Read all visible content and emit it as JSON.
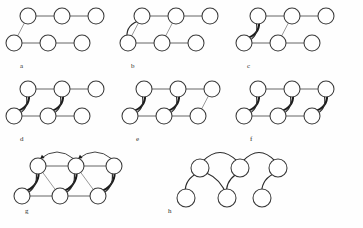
{
  "figure": {
    "background_color": "#fefefe",
    "node_fill": "#ffffff",
    "node_stroke": "#3a3a3a",
    "edge_color": "#555555",
    "curve_color": "#2b2b2b",
    "arrow_color": "#1a1a1a",
    "width": 363,
    "height": 228,
    "panel_count": 8
  },
  "panels": [
    {
      "label": "a",
      "label_x": 20,
      "label_y": 68,
      "origin_x": 14,
      "origin_y": 8,
      "node_count": 6,
      "description": "base lattice: top row three nodes, bottom row three nodes, one diagonal",
      "nodes": [
        {
          "id": "t1",
          "cx": 28,
          "cy": 16,
          "r": 8
        },
        {
          "id": "t2",
          "cx": 62,
          "cy": 16,
          "r": 8
        },
        {
          "id": "t3",
          "cx": 96,
          "cy": 16,
          "r": 8
        },
        {
          "id": "b1",
          "cx": 14,
          "cy": 43,
          "r": 8
        },
        {
          "id": "b2",
          "cx": 48,
          "cy": 43,
          "r": 8
        },
        {
          "id": "b3",
          "cx": 82,
          "cy": 43,
          "r": 8
        }
      ],
      "straight_edges": [
        {
          "from": "t3",
          "to": "t2"
        },
        {
          "from": "t2",
          "to": "t1"
        },
        {
          "from": "b1",
          "to": "b2"
        },
        {
          "from": "b2",
          "to": "b3"
        }
      ],
      "diagonal_edges": [
        {
          "from": "b1",
          "to": "t1"
        }
      ],
      "curved_edges": []
    },
    {
      "label": "b",
      "label_x": 131,
      "label_y": 68,
      "origin_x": 128,
      "origin_y": 8,
      "node_count": 6,
      "description": "adds a curved return edge t1->b1 and a thin diagonal b2->t2",
      "nodes": [
        {
          "id": "t1",
          "cx": 142,
          "cy": 16,
          "r": 8
        },
        {
          "id": "t2",
          "cx": 176,
          "cy": 16,
          "r": 8
        },
        {
          "id": "t3",
          "cx": 210,
          "cy": 16,
          "r": 8
        },
        {
          "id": "b1",
          "cx": 128,
          "cy": 43,
          "r": 8
        },
        {
          "id": "b2",
          "cx": 162,
          "cy": 43,
          "r": 8
        },
        {
          "id": "b3",
          "cx": 196,
          "cy": 43,
          "r": 8
        }
      ],
      "straight_edges": [
        {
          "from": "t3",
          "to": "t2"
        },
        {
          "from": "t2",
          "to": "t1"
        },
        {
          "from": "b1",
          "to": "b2"
        },
        {
          "from": "b2",
          "to": "b3"
        }
      ],
      "diagonal_edges": [
        {
          "from": "b1",
          "to": "t1"
        },
        {
          "from": "b2",
          "to": "t2"
        }
      ],
      "curved_edges": [
        {
          "from": "t1",
          "to": "b1",
          "bow": 9,
          "weight": "normal"
        }
      ]
    },
    {
      "label": "c",
      "label_x": 247,
      "label_y": 68,
      "origin_x": 244,
      "origin_y": 8,
      "node_count": 6,
      "description": "first curved pair thickened into a bold double arc at left",
      "nodes": [
        {
          "id": "t1",
          "cx": 258,
          "cy": 16,
          "r": 8
        },
        {
          "id": "t2",
          "cx": 292,
          "cy": 16,
          "r": 8
        },
        {
          "id": "t3",
          "cx": 326,
          "cy": 16,
          "r": 8
        },
        {
          "id": "b1",
          "cx": 244,
          "cy": 43,
          "r": 8
        },
        {
          "id": "b2",
          "cx": 278,
          "cy": 43,
          "r": 8
        },
        {
          "id": "b3",
          "cx": 312,
          "cy": 43,
          "r": 8
        }
      ],
      "straight_edges": [
        {
          "from": "t3",
          "to": "t2"
        },
        {
          "from": "t2",
          "to": "t1"
        },
        {
          "from": "b1",
          "to": "b2"
        },
        {
          "from": "b2",
          "to": "b3"
        }
      ],
      "diagonal_edges": [
        {
          "from": "b2",
          "to": "t2"
        }
      ],
      "curved_edges": [
        {
          "from": "b1",
          "to": "t1",
          "bow": 9,
          "weight": "bold"
        },
        {
          "from": "t1",
          "to": "b1",
          "bow": -9,
          "weight": "normal"
        }
      ]
    },
    {
      "label": "d",
      "label_x": 20,
      "label_y": 141,
      "origin_x": 14,
      "origin_y": 81,
      "node_count": 6,
      "description": "two curved double-arc pairs at columns one and two",
      "nodes": [
        {
          "id": "t1",
          "cx": 28,
          "cy": 89,
          "r": 8
        },
        {
          "id": "t2",
          "cx": 62,
          "cy": 89,
          "r": 8
        },
        {
          "id": "t3",
          "cx": 96,
          "cy": 89,
          "r": 8
        },
        {
          "id": "b1",
          "cx": 14,
          "cy": 116,
          "r": 8
        },
        {
          "id": "b2",
          "cx": 48,
          "cy": 116,
          "r": 8
        },
        {
          "id": "b3",
          "cx": 82,
          "cy": 116,
          "r": 8
        }
      ],
      "straight_edges": [
        {
          "from": "t3",
          "to": "t2"
        },
        {
          "from": "t2",
          "to": "t1"
        },
        {
          "from": "b1",
          "to": "b2"
        },
        {
          "from": "b2",
          "to": "b3"
        }
      ],
      "diagonal_edges": [],
      "curved_edges": [
        {
          "from": "b1",
          "to": "t1",
          "bow": 9,
          "weight": "bold"
        },
        {
          "from": "t1",
          "to": "b1",
          "bow": -9,
          "weight": "normal"
        },
        {
          "from": "b2",
          "to": "t2",
          "bow": 9,
          "weight": "bold"
        },
        {
          "from": "t2",
          "to": "b2",
          "bow": -9,
          "weight": "normal"
        }
      ]
    },
    {
      "label": "e",
      "label_x": 136,
      "label_y": 141,
      "origin_x": 130,
      "origin_y": 81,
      "node_count": 6,
      "description": "two curved pairs plus a thin diagonal at column three",
      "nodes": [
        {
          "id": "t1",
          "cx": 144,
          "cy": 89,
          "r": 8
        },
        {
          "id": "t2",
          "cx": 178,
          "cy": 89,
          "r": 8
        },
        {
          "id": "t3",
          "cx": 212,
          "cy": 89,
          "r": 8
        },
        {
          "id": "b1",
          "cx": 130,
          "cy": 116,
          "r": 8
        },
        {
          "id": "b2",
          "cx": 164,
          "cy": 116,
          "r": 8
        },
        {
          "id": "b3",
          "cx": 198,
          "cy": 116,
          "r": 8
        }
      ],
      "straight_edges": [
        {
          "from": "t3",
          "to": "t2"
        },
        {
          "from": "t2",
          "to": "t1"
        },
        {
          "from": "b1",
          "to": "b2"
        },
        {
          "from": "b2",
          "to": "b3"
        }
      ],
      "diagonal_edges": [
        {
          "from": "b3",
          "to": "t3"
        }
      ],
      "curved_edges": [
        {
          "from": "b1",
          "to": "t1",
          "bow": 9,
          "weight": "bold"
        },
        {
          "from": "t1",
          "to": "b1",
          "bow": -9,
          "weight": "normal"
        },
        {
          "from": "b2",
          "to": "t2",
          "bow": 9,
          "weight": "bold"
        },
        {
          "from": "t2",
          "to": "b2",
          "bow": -9,
          "weight": "normal"
        }
      ]
    },
    {
      "label": "f",
      "label_x": 250,
      "label_y": 141,
      "origin_x": 244,
      "origin_y": 81,
      "node_count": 6,
      "description": "all three columns carry curved double-arc pairs",
      "nodes": [
        {
          "id": "t1",
          "cx": 258,
          "cy": 89,
          "r": 8
        },
        {
          "id": "t2",
          "cx": 292,
          "cy": 89,
          "r": 8
        },
        {
          "id": "t3",
          "cx": 326,
          "cy": 89,
          "r": 8
        },
        {
          "id": "b1",
          "cx": 244,
          "cy": 116,
          "r": 8
        },
        {
          "id": "b2",
          "cx": 278,
          "cy": 116,
          "r": 8
        },
        {
          "id": "b3",
          "cx": 312,
          "cy": 116,
          "r": 8
        }
      ],
      "straight_edges": [
        {
          "from": "t3",
          "to": "t2"
        },
        {
          "from": "t2",
          "to": "t1"
        },
        {
          "from": "b1",
          "to": "b2"
        },
        {
          "from": "b2",
          "to": "b3"
        }
      ],
      "diagonal_edges": [],
      "curved_edges": [
        {
          "from": "b1",
          "to": "t1",
          "bow": 9,
          "weight": "bold"
        },
        {
          "from": "t1",
          "to": "b1",
          "bow": -9,
          "weight": "normal"
        },
        {
          "from": "b2",
          "to": "t2",
          "bow": 9,
          "weight": "bold"
        },
        {
          "from": "t2",
          "to": "b2",
          "bow": -9,
          "weight": "normal"
        },
        {
          "from": "b3",
          "to": "t3",
          "bow": 9,
          "weight": "bold"
        },
        {
          "from": "t3",
          "to": "b3",
          "bow": -9,
          "weight": "normal"
        }
      ]
    },
    {
      "label": "g",
      "label_x": 25,
      "label_y": 213,
      "origin_x": 22,
      "origin_y": 152,
      "node_count": 6,
      "description": "complete graph: adds long arcs over the top row and cross diagonals",
      "nodes": [
        {
          "id": "t1",
          "cx": 38,
          "cy": 166,
          "r": 8
        },
        {
          "id": "t2",
          "cx": 76,
          "cy": 166,
          "r": 8
        },
        {
          "id": "t3",
          "cx": 114,
          "cy": 166,
          "r": 8
        },
        {
          "id": "b1",
          "cx": 22,
          "cy": 196,
          "r": 8
        },
        {
          "id": "b2",
          "cx": 60,
          "cy": 196,
          "r": 8
        },
        {
          "id": "b3",
          "cx": 98,
          "cy": 196,
          "r": 8
        }
      ],
      "straight_edges": [
        {
          "from": "t3",
          "to": "t2"
        },
        {
          "from": "t2",
          "to": "t1"
        },
        {
          "from": "b1",
          "to": "b2"
        },
        {
          "from": "b2",
          "to": "b3"
        }
      ],
      "diagonal_edges": [
        {
          "from": "t1",
          "to": "b2"
        },
        {
          "from": "t2",
          "to": "b3"
        }
      ],
      "curved_edges": [
        {
          "from": "b1",
          "to": "t1",
          "bow": 9,
          "weight": "bold"
        },
        {
          "from": "t1",
          "to": "b1",
          "bow": -9,
          "weight": "normal"
        },
        {
          "from": "b2",
          "to": "t2",
          "bow": 9,
          "weight": "bold"
        },
        {
          "from": "t2",
          "to": "b2",
          "bow": -9,
          "weight": "normal"
        },
        {
          "from": "b3",
          "to": "t3",
          "bow": 9,
          "weight": "bold"
        },
        {
          "from": "t3",
          "to": "b3",
          "bow": -9,
          "weight": "normal"
        }
      ],
      "top_arcs": [
        {
          "from": "t1",
          "to": "t2",
          "rise": 14
        },
        {
          "from": "t2",
          "to": "t3",
          "rise": 14
        }
      ]
    },
    {
      "label": "h",
      "label_x": 168,
      "label_y": 213,
      "origin_x": 186,
      "origin_y": 152,
      "node_count": 6,
      "description": "resulting spanning tree drawn with smooth curved edges only, no arrowheads",
      "nodes": [
        {
          "id": "t1",
          "cx": 200,
          "cy": 168,
          "r": 9
        },
        {
          "id": "t2",
          "cx": 240,
          "cy": 168,
          "r": 9
        },
        {
          "id": "t3",
          "cx": 278,
          "cy": 168,
          "r": 9
        },
        {
          "id": "b1",
          "cx": 186,
          "cy": 198,
          "r": 9
        },
        {
          "id": "b2",
          "cx": 227,
          "cy": 198,
          "r": 9
        },
        {
          "id": "b3",
          "cx": 262,
          "cy": 198,
          "r": 9
        }
      ],
      "straight_edges": [],
      "diagonal_edges": [],
      "curved_edges": [
        {
          "from": "t1",
          "to": "b1",
          "bow": 8,
          "weight": "tree"
        },
        {
          "from": "t1",
          "to": "b2",
          "bow": -7,
          "weight": "tree"
        },
        {
          "from": "t2",
          "to": "b2",
          "bow": 7,
          "weight": "tree"
        },
        {
          "from": "t3",
          "to": "b3",
          "bow": 8,
          "weight": "tree"
        }
      ],
      "top_arcs": [
        {
          "from": "t1",
          "to": "t2",
          "rise": 17
        },
        {
          "from": "t2",
          "to": "t3",
          "rise": 17
        }
      ]
    }
  ]
}
